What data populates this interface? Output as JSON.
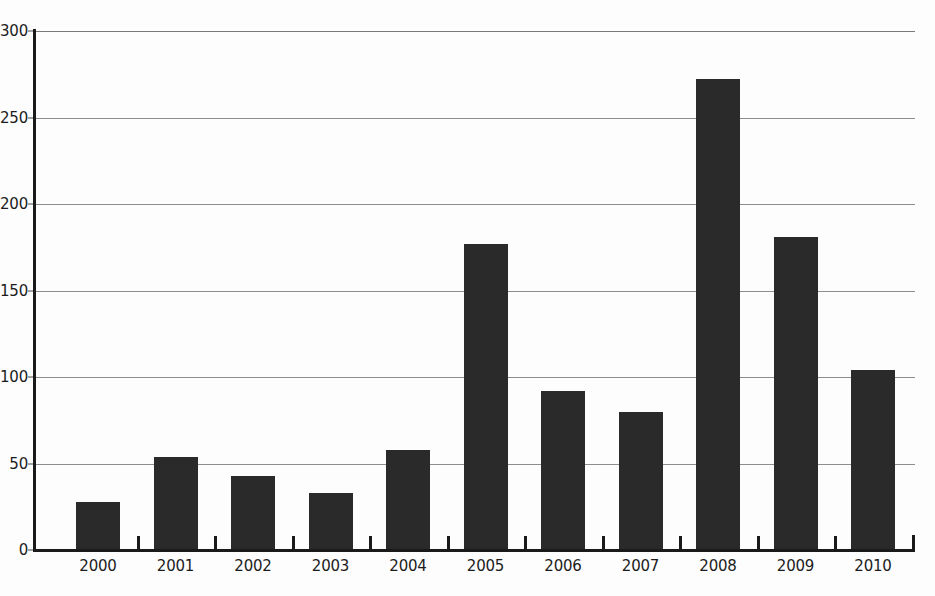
{
  "chart_data": {
    "type": "bar",
    "title": "",
    "subtitle": "",
    "xlabel": "",
    "ylabel": "",
    "categories": [
      "2000",
      "2001",
      "2002",
      "2003",
      "2004",
      "2005",
      "2006",
      "2007",
      "2008",
      "2009",
      "2010"
    ],
    "values": [
      28,
      54,
      43,
      33,
      58,
      177,
      92,
      80,
      272,
      181,
      104
    ],
    "ylim": [
      0,
      300
    ],
    "yticks": [
      0,
      50,
      100,
      150,
      200,
      250,
      300
    ],
    "ytick_labels": [
      "0",
      "50",
      "100",
      "150",
      "200",
      "250",
      "300"
    ],
    "grid": true,
    "grid_axis": "y",
    "legend": null,
    "legend_position": "none",
    "bar_color": "#2a2a2a",
    "background_color": "#fdfdfd",
    "axis_color": "#1a1a1a",
    "gridline_color": "#8d8d8d"
  }
}
